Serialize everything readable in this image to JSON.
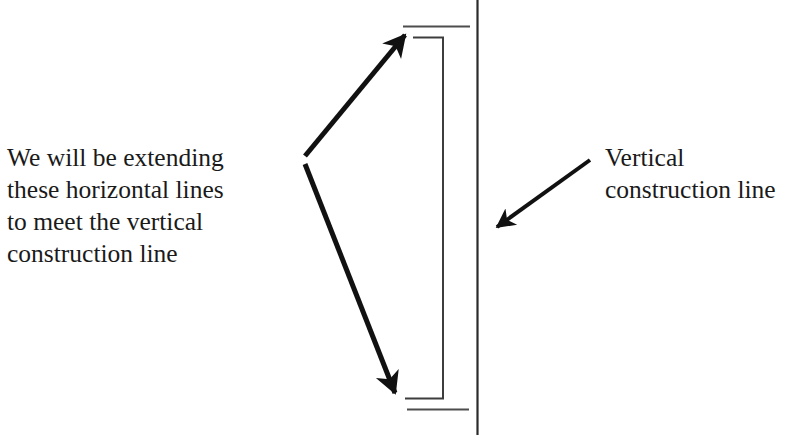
{
  "page": {
    "background_color": "#ffffff",
    "width": 811,
    "height": 435
  },
  "annotations": {
    "left": {
      "name": "extending-horizontal-lines-note",
      "text": "We will be extending\nthese horizontal lines\nto meet the vertical\nconstruction line",
      "color": "#1a1a1a"
    },
    "right": {
      "name": "vertical-construction-line-label",
      "text": "Vertical\nconstruction line",
      "color": "#1a1a1a"
    }
  },
  "graphics": {
    "stroke_color": "#111111",
    "thin_stroke_color": "#555555",
    "construction_line": {
      "label": "vertical-construction-line",
      "x": 477.5,
      "y1": 0,
      "y2": 435,
      "width": 2
    },
    "pointer_arrows": [
      {
        "label": "upper-leader-arrow",
        "x1": 304,
        "y1": 157,
        "x2": 411,
        "y2": 29,
        "width": 5
      },
      {
        "label": "lower-leader-arrow",
        "x1": 304,
        "y1": 163,
        "x2": 399,
        "y2": 402,
        "width": 5
      },
      {
        "label": "construction-line-callout-arrow",
        "x1": 590,
        "y1": 160,
        "x2": 491,
        "y2": 232,
        "width": 4
      }
    ],
    "thin_lines": [
      {
        "label": "top-horizontal-edge-line",
        "x1": 403,
        "y1": 26.5,
        "x2": 470,
        "y2": 26.5,
        "width": 2
      },
      {
        "label": "top-inner-horizontal-line",
        "x1": 413,
        "y1": 37.5,
        "x2": 443,
        "y2": 37.5,
        "width": 2
      },
      {
        "label": "inner-vertical-line",
        "x1": 443,
        "y1": 37.5,
        "x2": 443,
        "y2": 398.5,
        "width": 2
      },
      {
        "label": "bottom-inner-horizontal-line",
        "x1": 406,
        "y1": 398.5,
        "x2": 443,
        "y2": 398.5,
        "width": 2
      },
      {
        "label": "bottom-horizontal-edge-line",
        "x1": 407,
        "y1": 409.5,
        "x2": 469,
        "y2": 409.5,
        "width": 2
      }
    ]
  }
}
